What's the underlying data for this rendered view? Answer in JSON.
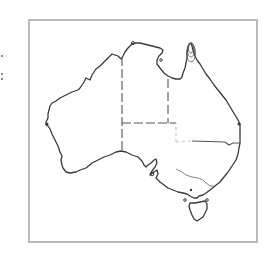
{
  "map": {
    "title": "",
    "region": "Australia",
    "style": "outline",
    "colors": {
      "frame_border": "#b9b9b9",
      "coastline": "#3a3a3a",
      "state_borders": "#555555",
      "river_lines": "#777777",
      "background": "#ffffff"
    },
    "features": [
      {
        "type": "coastline",
        "name": "mainland"
      },
      {
        "type": "coastline",
        "name": "tasmania"
      },
      {
        "type": "border",
        "name": "wa-nt-sa-border"
      },
      {
        "type": "border",
        "name": "nt-qld-border"
      },
      {
        "type": "border",
        "name": "nt-sa-border"
      },
      {
        "type": "border",
        "name": "qld-nsw-border"
      },
      {
        "type": "river",
        "name": "murray-river"
      },
      {
        "type": "contour",
        "name": "cape-york-contours"
      }
    ]
  }
}
